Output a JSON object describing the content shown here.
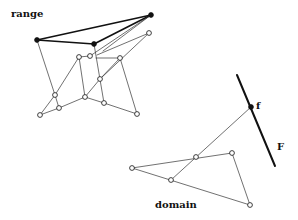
{
  "labels": {
    "range": "range",
    "domain": "domain",
    "point_f": "f",
    "line_F": "F"
  },
  "colors": {
    "stroke": "#333333",
    "bold_stroke": "#111111",
    "open_fill": "#ffffff",
    "solid_fill": "#111111",
    "background": "#ffffff"
  },
  "range": {
    "solid_points": [
      [
        37,
        40
      ],
      [
        94,
        44
      ],
      [
        151,
        15
      ]
    ],
    "open_points": [
      [
        149,
        33
      ],
      [
        79,
        57
      ],
      [
        90,
        56
      ],
      [
        120,
        58
      ],
      [
        100,
        79
      ],
      [
        55,
        95
      ],
      [
        85,
        97
      ],
      [
        104,
        103
      ],
      [
        40,
        115
      ],
      [
        59,
        108
      ],
      [
        137,
        114
      ]
    ],
    "bold_edges": [
      [
        [
          37,
          40
        ],
        [
          151,
          15
        ]
      ],
      [
        [
          37,
          40
        ],
        [
          94,
          44
        ]
      ],
      [
        [
          94,
          44
        ],
        [
          151,
          15
        ]
      ]
    ],
    "thin_edges": [
      [
        [
          37,
          40
        ],
        [
          55,
          95
        ]
      ],
      [
        [
          94,
          44
        ],
        [
          104,
          103
        ]
      ],
      [
        [
          151,
          15
        ],
        [
          90,
          56
        ]
      ],
      [
        [
          151,
          15
        ],
        [
          103,
          51
        ]
      ],
      [
        [
          149,
          33
        ],
        [
          97,
          55
        ]
      ],
      [
        [
          149,
          33
        ],
        [
          100,
          79
        ]
      ],
      [
        [
          79,
          57
        ],
        [
          90,
          56
        ]
      ],
      [
        [
          79,
          57
        ],
        [
          85,
          97
        ]
      ],
      [
        [
          79,
          57
        ],
        [
          55,
          95
        ]
      ],
      [
        [
          96,
          58
        ],
        [
          120,
          58
        ]
      ],
      [
        [
          120,
          58
        ],
        [
          100,
          79
        ]
      ],
      [
        [
          120,
          58
        ],
        [
          137,
          114
        ]
      ],
      [
        [
          100,
          79
        ],
        [
          85,
          97
        ]
      ],
      [
        [
          55,
          95
        ],
        [
          40,
          115
        ]
      ],
      [
        [
          55,
          95
        ],
        [
          59,
          108
        ]
      ],
      [
        [
          85,
          97
        ],
        [
          59,
          108
        ]
      ],
      [
        [
          85,
          97
        ],
        [
          104,
          103
        ]
      ],
      [
        [
          104,
          103
        ],
        [
          137,
          114
        ]
      ],
      [
        [
          59,
          108
        ],
        [
          40,
          115
        ]
      ]
    ]
  },
  "domain": {
    "open_points": [
      [
        132,
        168
      ],
      [
        196,
        157
      ],
      [
        232,
        153
      ],
      [
        171,
        180
      ],
      [
        250,
        205
      ]
    ],
    "edges": [
      [
        [
          132,
          168
        ],
        [
          232,
          153
        ]
      ],
      [
        [
          132,
          168
        ],
        [
          250,
          205
        ]
      ],
      [
        [
          232,
          153
        ],
        [
          250,
          205
        ]
      ],
      [
        [
          171,
          180
        ],
        [
          251,
          107
        ]
      ]
    ]
  },
  "line_F": {
    "start": [
      237,
      75
    ],
    "end": [
      275,
      166
    ],
    "point_f": [
      251,
      107
    ]
  }
}
